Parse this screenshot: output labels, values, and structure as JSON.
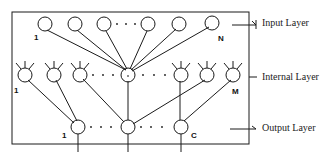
{
  "diagram": {
    "colors": {
      "stroke": "#1a1a1a",
      "background": "#ffffff"
    },
    "box": {
      "x": 12,
      "y": 12,
      "w": 237,
      "h": 132
    },
    "layers": [
      {
        "id": "input",
        "label": "Input Layer",
        "first_index": "1",
        "last_index": "N"
      },
      {
        "id": "internal",
        "label": "Internal Layer",
        "first_index": "1",
        "last_index": "M"
      },
      {
        "id": "output",
        "label": "Output Layer",
        "first_index": "1",
        "last_index": "C"
      }
    ],
    "ellipsis": "· · ·"
  }
}
